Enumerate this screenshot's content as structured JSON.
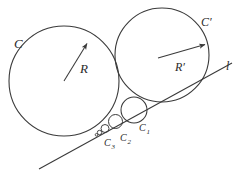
{
  "figure": {
    "background": "#ffffff",
    "stroke": "#3a3a3a",
    "label_color": "#2b2b2b",
    "width": 237,
    "height": 175
  },
  "labels": {
    "circle_c": "C",
    "circle_c_prime": "C′",
    "radius_r": "R",
    "radius_r_prime": "R′",
    "line_l": "l",
    "c1": "C",
    "c1_sub": "1",
    "c2": "C",
    "c2_sub": "2",
    "c3": "C",
    "c3_sub": "3"
  },
  "geometry": {
    "circle_c": {
      "cx": 64,
      "cy": 81,
      "r": 55
    },
    "circle_c_prime": {
      "cx": 162,
      "cy": 55,
      "r": 47
    },
    "chain": [
      {
        "name": "C1",
        "cx": 134,
        "cy": 110,
        "r": 13
      },
      {
        "name": "C2",
        "cx": 115.5,
        "cy": 121.5,
        "r": 7
      },
      {
        "name": "C3",
        "cx": 105,
        "cy": 128.5,
        "r": 4
      },
      {
        "name": "C4",
        "cx": 99.5,
        "cy": 132.5,
        "r": 2.2
      },
      {
        "name": "C5",
        "cx": 96.5,
        "cy": 134.8,
        "r": 1.3
      }
    ],
    "line_l": {
      "x1": 39,
      "y1": 169,
      "x2": 232,
      "y2": 63
    },
    "arrow_r": {
      "x1": 64,
      "y1": 81,
      "x2": 88,
      "y2": 42
    },
    "arrow_r_prime": {
      "x1": 158,
      "y1": 58,
      "x2": 206,
      "y2": 44
    }
  },
  "label_positions": {
    "circle_c": {
      "x": 14,
      "y": 48
    },
    "circle_c_prime": {
      "x": 201,
      "y": 26
    },
    "radius_r": {
      "x": 80,
      "y": 72
    },
    "radius_r_prime": {
      "x": 175,
      "y": 70
    },
    "line_l": {
      "x": 226,
      "y": 70
    },
    "c1": {
      "x": 139,
      "y": 131
    },
    "c2": {
      "x": 120,
      "y": 142
    },
    "c3": {
      "x": 104,
      "y": 146
    }
  }
}
